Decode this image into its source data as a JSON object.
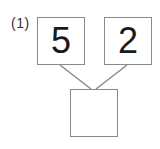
{
  "problem": {
    "label": "(1)",
    "top_left_value": "5",
    "top_right_value": "2",
    "bottom_value": ""
  },
  "colors": {
    "border": "#8a8a8a",
    "text": "#1a1a1a"
  }
}
